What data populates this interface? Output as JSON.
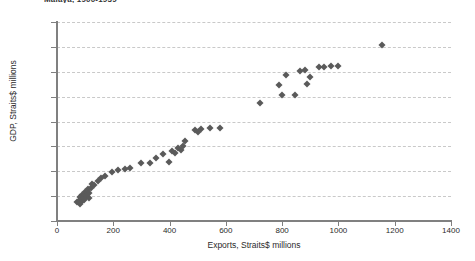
{
  "chart_data": {
    "type": "scatter",
    "title": "Malaya, 1900-1939",
    "xlabel": "Exports, Straits$ millions",
    "ylabel": "GDP, Straits$ millions",
    "xlim": [
      0,
      1400
    ],
    "ylim": [
      0,
      1600
    ],
    "xticks": [
      0,
      200,
      400,
      600,
      800,
      1000,
      1200,
      1400
    ],
    "yticks": [
      0,
      200,
      400,
      600,
      800,
      1000,
      1200,
      1400,
      1600
    ],
    "xtick_labels": [
      "0",
      "200",
      "400",
      "600",
      "800",
      "1000",
      "1200",
      "1400"
    ],
    "ytick_labels": [
      "0",
      "200",
      "400",
      "600",
      "800",
      "1,000",
      "1,200",
      "1,400",
      "1,600"
    ],
    "grid": "horizontal-dashed",
    "legend": "none",
    "marker": "diamond",
    "marker_color": "#5a5a5a",
    "marker_size": 5,
    "series": [
      {
        "name": "Malaya GDP vs Exports",
        "points": [
          [
            72,
            150
          ],
          [
            78,
            163
          ],
          [
            80,
            195
          ],
          [
            83,
            140
          ],
          [
            85,
            178
          ],
          [
            88,
            210
          ],
          [
            90,
            160
          ],
          [
            92,
            188
          ],
          [
            95,
            205
          ],
          [
            97,
            172
          ],
          [
            100,
            230
          ],
          [
            103,
            196
          ],
          [
            106,
            215
          ],
          [
            110,
            255
          ],
          [
            112,
            182
          ],
          [
            115,
            228
          ],
          [
            120,
            268
          ],
          [
            126,
            300
          ],
          [
            133,
            290
          ],
          [
            146,
            325
          ],
          [
            158,
            345
          ],
          [
            172,
            360
          ],
          [
            196,
            395
          ],
          [
            215,
            408
          ],
          [
            243,
            420
          ],
          [
            258,
            428
          ],
          [
            300,
            470
          ],
          [
            330,
            468
          ],
          [
            352,
            505
          ],
          [
            378,
            540
          ],
          [
            398,
            475
          ],
          [
            408,
            560
          ],
          [
            420,
            545
          ],
          [
            430,
            590
          ],
          [
            440,
            570
          ],
          [
            448,
            600
          ],
          [
            455,
            640
          ],
          [
            492,
            728
          ],
          [
            500,
            712
          ],
          [
            512,
            740
          ],
          [
            545,
            745
          ],
          [
            578,
            748
          ],
          [
            722,
            948
          ],
          [
            790,
            1090
          ],
          [
            800,
            1010
          ],
          [
            812,
            1172
          ],
          [
            845,
            1010
          ],
          [
            862,
            1205
          ],
          [
            880,
            1215
          ],
          [
            890,
            1100
          ],
          [
            900,
            1155
          ],
          [
            930,
            1240
          ],
          [
            948,
            1238
          ],
          [
            975,
            1248
          ],
          [
            1000,
            1245
          ],
          [
            1155,
            1415
          ]
        ]
      }
    ]
  }
}
